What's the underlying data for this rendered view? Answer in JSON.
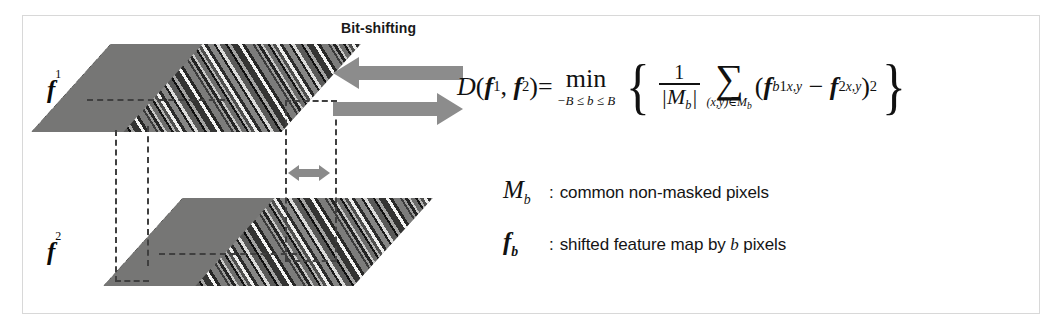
{
  "figure": {
    "caption_region": "bit-shifting feature map distance diagram"
  },
  "diagram": {
    "bitshift_label": "Bit-shifting",
    "map_top_label": "f",
    "map_top_superscript": "1",
    "map_bottom_label": "f",
    "map_bottom_superscript": "2",
    "arrow_left_name": "left-arrow",
    "arrow_right_name": "right-arrow",
    "shift_arrow_name": "double-headed-shift-arrow"
  },
  "equation": {
    "lhs_D": "D",
    "paren_open": "(",
    "f": "f",
    "sup1": "1",
    "comma": ",",
    "sup2": "2",
    "paren_close": ")",
    "equals": "=",
    "min_operator": "min",
    "min_range": "−B ≤ b ≤ B",
    "brace_open": "{",
    "brace_close": "}",
    "fraction_numerator": "1",
    "fraction_denominator": "|M",
    "fraction_denominator_sub": "b",
    "fraction_denominator_close": "|",
    "sum_symbol": "∑",
    "sum_index": "(x,y)∈M",
    "sum_index_sub": "b",
    "term_open": "(",
    "term_f1": "f",
    "term_f1_sub": "b",
    "term_f1_sup": "1",
    "term_f1_xy": "x,y",
    "minus": "−",
    "term_f2": "f",
    "term_f2_sup": "2",
    "term_f2_xy": "x,y",
    "term_close": ")",
    "term_power": "2",
    "plain_text": "D(f1, f2) = min over −B ≤ b ≤ B of { 1/|Mb| · Σ over (x,y)∈Mb of (fb1 x,y − f2 x,y)2 }"
  },
  "legend": [
    {
      "symbol": "M",
      "symbol_sub": "b",
      "bold": false,
      "colon": ":",
      "description": "common non-masked pixels",
      "description_pre": "common non-masked pixels",
      "description_italic": "",
      "description_post": ""
    },
    {
      "symbol": "f",
      "symbol_sub": "b",
      "bold": true,
      "colon": ":",
      "description": "shifted feature map by b pixels",
      "description_pre": "shifted feature map by ",
      "description_italic": "b",
      "description_post": " pixels"
    }
  ],
  "colors": {
    "arrow_gray": "#8c8c8c",
    "map_base_gray": "#767675",
    "frame_border": "#d8d8d8",
    "dash_line": "#3f3f3f",
    "text_black": "#111111",
    "background": "#ffffff"
  }
}
